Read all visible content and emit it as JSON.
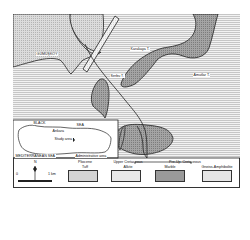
{
  "map": {
    "labels": {
      "gumuskoy": "GÜMÜŞKÖY",
      "karakaya": "Karakaya T.",
      "serbu": "Serbu T.",
      "amutlar": "Amutlar T.",
      "fault": "fault"
    },
    "inset": {
      "black_sea": "BLACK",
      "sea": "SEA",
      "ankara": "Ankara",
      "study_area": "Study area",
      "mediterranean": "MEDITERRANEAN SEA",
      "scale_note": "Administrative area"
    },
    "legend": {
      "north": "N",
      "scale_start": "0",
      "scale_end": "1 km",
      "pliocene_group": "Pliocene",
      "pliocene_unit": "Tuff",
      "upper_cretaceous_group": "Upper Cretaceous",
      "upper_cretaceous_unit": "Alkite",
      "pre_cretaceous_group": "Pre-Up. Cretaceous",
      "marble_unit": "Marble",
      "gneiss_unit": "Gneiss-Amphibolite"
    },
    "colors": {
      "tuff_fill": "#d4d4d4",
      "alkite_fill": "#e8e8e8",
      "marble_fill": "#9a9a9a",
      "gneiss_fill": "#e6e6e6",
      "outline": "#222222"
    }
  }
}
